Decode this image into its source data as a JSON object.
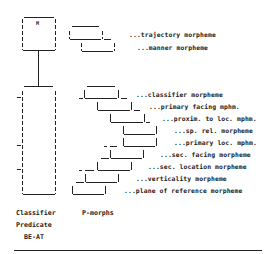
{
  "diagram": {
    "top_box": {
      "glyph": "M"
    },
    "upper_morphemes": [
      {
        "label": "...trajectory morpheme"
      },
      {
        "label": "...manner morpheme"
      }
    ],
    "p_morph_rows": [
      {
        "label": "...classifier morpheme"
      },
      {
        "label": "...primary facing mphm."
      },
      {
        "label": "...proxim. to loc. mphm."
      },
      {
        "label": "...sp. rel. morpheme"
      },
      {
        "label": "...primary loc. mphm."
      },
      {
        "label": "...sec. facing morpheme"
      },
      {
        "label": "...sec. location morpheme"
      },
      {
        "label": "...verticality morpheme"
      },
      {
        "label": "...plane of reference morpheme"
      }
    ],
    "captions": {
      "classifier_line1": "Classifier",
      "classifier_line2": "Predicate",
      "classifier_line3": "BE-AT",
      "pmorphs": "P-morphs"
    }
  }
}
